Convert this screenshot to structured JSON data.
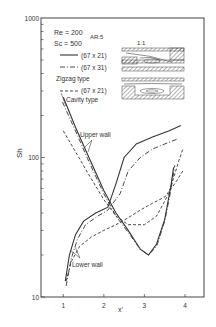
{
  "chart_data": {
    "type": "line",
    "title": "",
    "xlabel": "x'",
    "ylabel": "Sh",
    "yscale": "log",
    "xlim": [
      0.45,
      4.47
    ],
    "ylim": [
      10,
      1000
    ],
    "x_ticks": [
      "1",
      "2",
      "3",
      "4"
    ],
    "y_ticks": [
      "10",
      "100",
      "1000"
    ],
    "grid": false,
    "legend": {
      "position": "upper-left",
      "params": [
        "Re = 200",
        "Sc = 500"
      ],
      "aspect_ratio_label": "AR:5",
      "scale_label": "1:1",
      "groups": [
        {
          "name": "Zigzag type",
          "entries": [
            "(67 x 21)",
            "(67 x 31)"
          ]
        },
        {
          "name": "Cavity type",
          "entries": [
            "(67 x 21)"
          ]
        }
      ]
    },
    "annotations": [
      "Upper wall",
      "Lower wall"
    ],
    "series": [
      {
        "name": "Zigzag (67 x 21) upper wall",
        "style": "solid",
        "x": [
          1.0,
          1.3,
          1.6,
          2.0,
          2.3,
          2.6,
          2.9,
          3.1,
          3.3,
          3.5,
          3.65,
          3.72
        ],
        "y": [
          270,
          165,
          105,
          58,
          40,
          30,
          22,
          20,
          24,
          36,
          62,
          85
        ]
      },
      {
        "name": "Zigzag (67 x 31) upper wall",
        "style": "dashdot",
        "x": [
          0.98,
          1.3,
          1.6,
          2.0,
          2.3,
          2.6,
          2.9,
          3.1,
          3.3,
          3.5,
          3.65,
          3.75
        ],
        "y": [
          250,
          155,
          98,
          55,
          38,
          29,
          22,
          20,
          23,
          35,
          58,
          88
        ]
      },
      {
        "name": "Cavity (67 x 21) upper wall",
        "style": "dashed",
        "x": [
          1.0,
          1.3,
          1.6,
          2.0,
          2.3,
          2.6,
          3.0,
          3.3,
          3.6,
          3.85,
          3.95
        ],
        "y": [
          155,
          110,
          78,
          50,
          38,
          33,
          33,
          38,
          55,
          95,
          115
        ]
      },
      {
        "name": "Zigzag (67 x 21) lower wall",
        "style": "solid",
        "x": [
          1.05,
          1.15,
          1.3,
          1.5,
          1.8,
          2.1,
          2.3,
          2.5,
          2.8,
          3.2,
          3.6,
          3.9
        ],
        "y": [
          13,
          20,
          28,
          35,
          40,
          44,
          65,
          100,
          125,
          140,
          155,
          170
        ]
      },
      {
        "name": "Zigzag (67 x 31) lower wall",
        "style": "dashdot",
        "x": [
          1.07,
          1.2,
          1.35,
          1.55,
          1.85,
          2.1,
          2.4,
          2.6,
          2.9,
          3.2,
          3.5,
          3.8
        ],
        "y": [
          12,
          19,
          26,
          33,
          38,
          42,
          55,
          80,
          100,
          115,
          125,
          135
        ]
      },
      {
        "name": "Cavity (67 x 21) lower wall",
        "style": "dashed",
        "x": [
          1.07,
          1.2,
          1.4,
          1.7,
          2.0,
          2.3,
          2.6,
          2.9,
          3.2,
          3.5,
          3.75,
          3.95
        ],
        "y": [
          13,
          18,
          23,
          27,
          30,
          33,
          37,
          42,
          47,
          52,
          65,
          80
        ]
      }
    ]
  }
}
